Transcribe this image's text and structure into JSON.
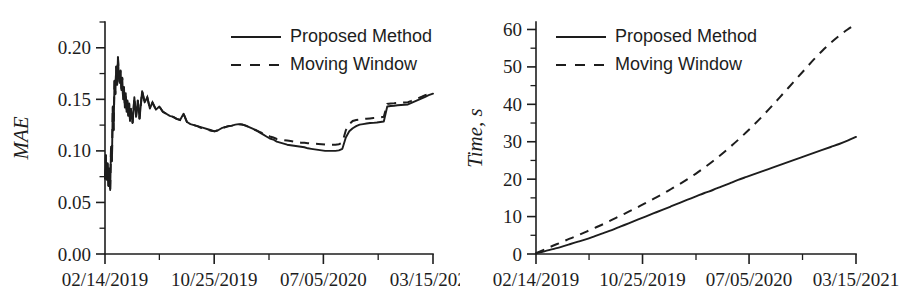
{
  "figure": {
    "background": "#ffffff",
    "ink_color": "#1d1d1d",
    "panel_count": 2
  },
  "chart_data": [
    {
      "id": "mae-chart",
      "type": "line",
      "title": "",
      "xlabel": "",
      "ylabel": "MAE",
      "ylim": [
        0.0,
        0.225
      ],
      "yticks": [
        0.0,
        0.05,
        0.1,
        0.15,
        0.2
      ],
      "ytick_labels": [
        "0.00",
        "0.05",
        "0.10",
        "0.15",
        "0.20"
      ],
      "y_minor_ticks": [
        0.025,
        0.075,
        0.125,
        0.175,
        0.225
      ],
      "xlim": [
        0,
        760
      ],
      "xticks": [
        0,
        253,
        506,
        760
      ],
      "xtick_labels": [
        "02/14/2019",
        "10/25/2019",
        "07/05/2020",
        "03/15/2021"
      ],
      "x_minor_ticks": [
        126,
        380,
        633
      ],
      "grid": false,
      "legend_position": "top-center",
      "legend": [
        "Proposed Method",
        "Moving Window"
      ],
      "series": [
        {
          "name": "Proposed Method",
          "style": "solid",
          "x": [
            0,
            2,
            4,
            6,
            8,
            10,
            12,
            14,
            16,
            18,
            20,
            22,
            24,
            26,
            28,
            30,
            32,
            34,
            36,
            38,
            40,
            42,
            44,
            46,
            48,
            50,
            52,
            54,
            56,
            58,
            60,
            64,
            68,
            72,
            76,
            80,
            86,
            92,
            98,
            104,
            110,
            118,
            126,
            134,
            142,
            150,
            158,
            166,
            174,
            182,
            190,
            198,
            206,
            214,
            222,
            230,
            238,
            246,
            254,
            262,
            270,
            278,
            286,
            294,
            302,
            310,
            318,
            326,
            334,
            342,
            350,
            358,
            366,
            374,
            382,
            390,
            398,
            406,
            414,
            422,
            430,
            438,
            446,
            454,
            462,
            470,
            478,
            486,
            494,
            502,
            510,
            518,
            526,
            534,
            542,
            550,
            558,
            566,
            574,
            582,
            590,
            598,
            606,
            614,
            622,
            630,
            638,
            646,
            654,
            662,
            670,
            678,
            686,
            694,
            702,
            710,
            718,
            726,
            734,
            742,
            750,
            760
          ],
          "y": [
            0.073,
            0.096,
            0.072,
            0.088,
            0.066,
            0.083,
            0.062,
            0.104,
            0.09,
            0.143,
            0.12,
            0.168,
            0.155,
            0.182,
            0.164,
            0.191,
            0.173,
            0.166,
            0.178,
            0.159,
            0.171,
            0.15,
            0.162,
            0.142,
            0.156,
            0.138,
            0.149,
            0.134,
            0.146,
            0.129,
            0.141,
            0.127,
            0.152,
            0.133,
            0.149,
            0.131,
            0.158,
            0.147,
            0.152,
            0.141,
            0.147,
            0.14,
            0.143,
            0.138,
            0.136,
            0.134,
            0.133,
            0.131,
            0.13,
            0.136,
            0.128,
            0.126,
            0.125,
            0.124,
            0.123,
            0.122,
            0.121,
            0.12,
            0.119,
            0.12,
            0.122,
            0.123,
            0.124,
            0.1245,
            0.1255,
            0.126,
            0.1255,
            0.1245,
            0.123,
            0.1215,
            0.12,
            0.118,
            0.116,
            0.114,
            0.112,
            0.111,
            0.109,
            0.108,
            0.107,
            0.106,
            0.1055,
            0.105,
            0.1045,
            0.104,
            0.1035,
            0.1025,
            0.102,
            0.1015,
            0.101,
            0.1005,
            0.1,
            0.1,
            0.1,
            0.1,
            0.1005,
            0.102,
            0.113,
            0.119,
            0.122,
            0.124,
            0.1255,
            0.126,
            0.1265,
            0.127,
            0.1272,
            0.1275,
            0.128,
            0.1285,
            0.143,
            0.1435,
            0.1438,
            0.1442,
            0.1445,
            0.1448,
            0.145,
            0.1465,
            0.148,
            0.1495,
            0.151,
            0.1525,
            0.154,
            0.1555,
            0.158
          ]
        },
        {
          "name": "Moving Window",
          "style": "dashed",
          "x": [
            0,
            2,
            4,
            6,
            8,
            10,
            12,
            14,
            16,
            18,
            20,
            22,
            24,
            26,
            28,
            30,
            32,
            34,
            36,
            38,
            40,
            42,
            44,
            46,
            48,
            50,
            52,
            54,
            56,
            58,
            60,
            64,
            68,
            72,
            76,
            80,
            86,
            92,
            98,
            104,
            110,
            118,
            126,
            134,
            142,
            150,
            158,
            166,
            174,
            182,
            190,
            198,
            206,
            214,
            222,
            230,
            238,
            246,
            254,
            262,
            270,
            278,
            286,
            294,
            302,
            310,
            318,
            326,
            334,
            342,
            350,
            358,
            366,
            374,
            382,
            390,
            398,
            406,
            414,
            422,
            430,
            438,
            446,
            454,
            462,
            470,
            478,
            486,
            494,
            502,
            510,
            518,
            526,
            534,
            542,
            550,
            558,
            566,
            574,
            582,
            590,
            598,
            606,
            614,
            622,
            630,
            638,
            646,
            654,
            662,
            670,
            678,
            686,
            694,
            702,
            710,
            718,
            726,
            734,
            742,
            750,
            760
          ],
          "y": [
            0.073,
            0.096,
            0.072,
            0.088,
            0.066,
            0.083,
            0.062,
            0.104,
            0.09,
            0.143,
            0.12,
            0.168,
            0.155,
            0.182,
            0.164,
            0.191,
            0.173,
            0.166,
            0.178,
            0.159,
            0.171,
            0.15,
            0.162,
            0.142,
            0.156,
            0.138,
            0.149,
            0.134,
            0.146,
            0.129,
            0.141,
            0.127,
            0.152,
            0.133,
            0.149,
            0.131,
            0.158,
            0.147,
            0.152,
            0.141,
            0.147,
            0.14,
            0.143,
            0.138,
            0.136,
            0.134,
            0.133,
            0.131,
            0.13,
            0.136,
            0.128,
            0.126,
            0.125,
            0.124,
            0.1225,
            0.1215,
            0.1205,
            0.1195,
            0.119,
            0.12,
            0.122,
            0.123,
            0.124,
            0.1245,
            0.1255,
            0.126,
            0.1255,
            0.1245,
            0.123,
            0.1215,
            0.12,
            0.1185,
            0.117,
            0.1155,
            0.114,
            0.113,
            0.1115,
            0.111,
            0.1105,
            0.11,
            0.1095,
            0.109,
            0.1085,
            0.108,
            0.1078,
            0.1075,
            0.1072,
            0.107,
            0.1068,
            0.1065,
            0.1062,
            0.106,
            0.106,
            0.106,
            0.1065,
            0.108,
            0.12,
            0.126,
            0.129,
            0.13,
            0.1305,
            0.131,
            0.1312,
            0.1315,
            0.1318,
            0.132,
            0.1325,
            0.133,
            0.1455,
            0.146,
            0.1462,
            0.1465,
            0.1468,
            0.147,
            0.1472,
            0.1485,
            0.15,
            0.1512,
            0.1525,
            0.154,
            0.1552,
            0.1565,
            0.159
          ]
        }
      ]
    },
    {
      "id": "time-chart",
      "type": "line",
      "title": "",
      "xlabel": "",
      "ylabel": "Time, s",
      "ylim": [
        0,
        62
      ],
      "yticks": [
        0,
        10,
        20,
        30,
        40,
        50,
        60
      ],
      "ytick_labels": [
        "0",
        "10",
        "20",
        "30",
        "40",
        "50",
        "60"
      ],
      "y_minor_ticks": [
        5,
        15,
        25,
        35,
        45,
        55
      ],
      "xlim": [
        0,
        760
      ],
      "xticks": [
        0,
        253,
        506,
        760
      ],
      "xtick_labels": [
        "02/14/2019",
        "10/25/2019",
        "07/05/2020",
        "03/15/2021"
      ],
      "x_minor_ticks": [
        126,
        380,
        633
      ],
      "grid": false,
      "legend_position": "top-center",
      "legend": [
        "Proposed Method",
        "Moving Window"
      ],
      "series": [
        {
          "name": "Proposed Method",
          "style": "solid",
          "x": [
            0,
            20,
            40,
            60,
            80,
            100,
            120,
            140,
            160,
            180,
            200,
            220,
            240,
            260,
            280,
            300,
            320,
            340,
            360,
            380,
            400,
            420,
            440,
            460,
            480,
            500,
            520,
            540,
            560,
            580,
            600,
            620,
            640,
            660,
            680,
            700,
            720,
            740,
            760
          ],
          "y": [
            0.2,
            0.7,
            1.3,
            1.9,
            2.6,
            3.3,
            4.0,
            4.8,
            5.6,
            6.4,
            7.3,
            8.2,
            9.1,
            10.0,
            10.9,
            11.8,
            12.7,
            13.6,
            14.5,
            15.4,
            16.3,
            17.1,
            18.0,
            18.9,
            19.8,
            20.6,
            21.4,
            22.2,
            23.0,
            23.8,
            24.6,
            25.4,
            26.2,
            27.0,
            27.8,
            28.6,
            29.4,
            30.3,
            31.3
          ]
        },
        {
          "name": "Moving Window",
          "style": "dashed",
          "x": [
            0,
            20,
            40,
            60,
            80,
            100,
            120,
            140,
            160,
            180,
            200,
            220,
            240,
            260,
            280,
            300,
            320,
            340,
            360,
            380,
            400,
            420,
            440,
            460,
            480,
            500,
            520,
            540,
            560,
            580,
            600,
            620,
            640,
            660,
            680,
            700,
            720,
            740,
            760
          ],
          "y": [
            0.2,
            1.2,
            2.2,
            3.1,
            4.1,
            5.0,
            6.0,
            7.0,
            8.0,
            9.1,
            10.2,
            11.3,
            12.4,
            13.6,
            14.8,
            16.0,
            17.3,
            18.6,
            20.0,
            21.5,
            23.1,
            24.8,
            26.6,
            28.5,
            30.5,
            32.6,
            34.8,
            37.1,
            39.5,
            42.0,
            44.5,
            47.0,
            49.5,
            52.0,
            54.3,
            56.4,
            58.3,
            60.0,
            61.5
          ]
        }
      ]
    }
  ]
}
